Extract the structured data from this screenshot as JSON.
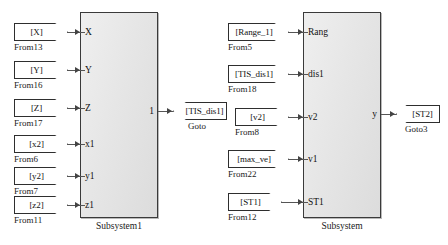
{
  "diagram": {
    "colors": {
      "block_fill": "#e8e8e8",
      "block_border": "#3a3a3a",
      "wire": "#555555",
      "tag_fill": "#ffffff",
      "tag_border": "#2e2e2e",
      "text": "#111111"
    }
  },
  "subsystems": [
    {
      "caption": "Subsystem1",
      "inputs": [
        "X",
        "Y",
        "Z",
        "x1",
        "y1",
        "z1"
      ],
      "outputs": [
        "1"
      ]
    },
    {
      "caption": "Subsystem",
      "inputs": [
        "Rang",
        "dis1",
        "v2",
        "v1",
        "ST1"
      ],
      "outputs": [
        "y"
      ]
    }
  ],
  "from_blocks": [
    {
      "tag": "[X]",
      "caption": "From13",
      "target_port": "X"
    },
    {
      "tag": "[Y]",
      "caption": "From16",
      "target_port": "Y"
    },
    {
      "tag": "[Z]",
      "caption": "From17",
      "target_port": "Z"
    },
    {
      "tag": "[x2]",
      "caption": "From6",
      "target_port": "x1"
    },
    {
      "tag": "[y2]",
      "caption": "From7",
      "target_port": "y1"
    },
    {
      "tag": "[z2]",
      "caption": "From11",
      "target_port": "z1"
    },
    {
      "tag": "[Range_1]",
      "caption": "From5",
      "target_port": "Rang"
    },
    {
      "tag": "[TIS_dis1]",
      "caption": "From18",
      "target_port": "dis1"
    },
    {
      "tag": "[v2]",
      "caption": "From8",
      "target_port": "v2"
    },
    {
      "tag": "[max_ve]",
      "caption": "From22",
      "target_port": "v1"
    },
    {
      "tag": "[ST1]",
      "caption": "From12",
      "target_port": "ST1"
    }
  ],
  "goto_blocks": [
    {
      "tag": "[TIS_dis1]",
      "caption": "Goto",
      "source_port": "1"
    },
    {
      "tag": "[ST2]",
      "caption": "Goto3",
      "source_port": "y"
    }
  ]
}
